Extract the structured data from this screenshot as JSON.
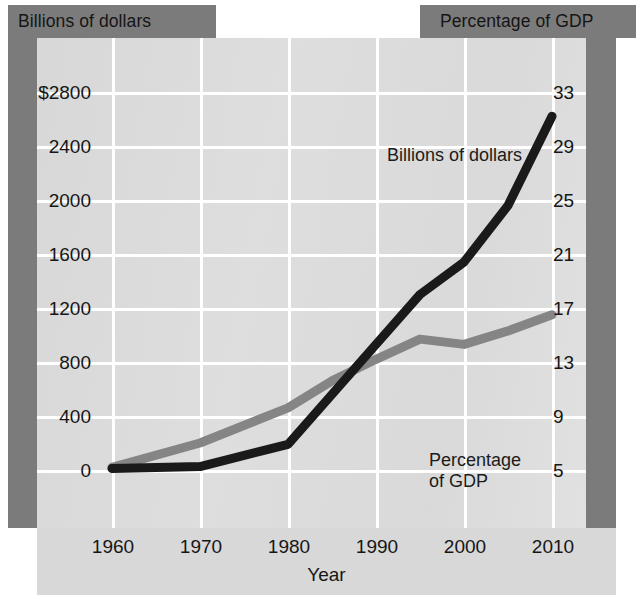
{
  "header": {
    "left_caption": "Billions of dollars",
    "right_caption": "Percentage of GDP"
  },
  "axes": {
    "x_title": "Year",
    "x_ticks": [
      "1960",
      "1970",
      "1980",
      "1990",
      "2000",
      "2010"
    ],
    "y_left_ticks": [
      "$2800",
      "2400",
      "2000",
      "1600",
      "1200",
      "800",
      "400",
      "0"
    ],
    "y_right_ticks": [
      "33",
      "29",
      "25",
      "21",
      "17",
      "13",
      "9",
      "5"
    ]
  },
  "annotations": {
    "dollars": "Billions of dollars",
    "gdp": "Percentage\nof GDP"
  },
  "colors": {
    "series_dollars": "#1a1a1a",
    "series_gdp": "#858585",
    "panel": "#dcdcdc",
    "band": "#7b7b7b",
    "gridline": "#ffffff",
    "text": "#161616"
  },
  "chart_data": {
    "type": "line",
    "title": "",
    "xlabel": "Year",
    "grid": true,
    "legend": "in-plot annotations",
    "x": [
      1960,
      1970,
      1980,
      1985,
      1990,
      1995,
      2000,
      2005,
      2010
    ],
    "xlim": [
      1960,
      2010
    ],
    "axes_spec": [
      {
        "id": "left",
        "label": "Billions of dollars",
        "ylim": [
          0,
          2800
        ],
        "ticks": [
          0,
          400,
          800,
          1200,
          1600,
          2000,
          2400,
          2800
        ],
        "tick_labels": [
          "0",
          "400",
          "800",
          "1200",
          "1600",
          "2000",
          "2400",
          "$2800"
        ]
      },
      {
        "id": "right",
        "label": "Percentage of GDP",
        "ylim": [
          5,
          33
        ],
        "ticks": [
          5,
          9,
          13,
          17,
          21,
          25,
          29,
          33
        ],
        "tick_labels": [
          "5",
          "9",
          "13",
          "17",
          "21",
          "25",
          "29",
          "33"
        ]
      }
    ],
    "series": [
      {
        "name": "Billions of dollars",
        "axis": "left",
        "color": "#1a1a1a",
        "values": [
          10,
          25,
          190,
          560,
          930,
          1300,
          1540,
          1960,
          2620
        ]
      },
      {
        "name": "Percentage of GDP",
        "axis": "right",
        "color": "#858585",
        "values": [
          5.2,
          7.0,
          9.6,
          11.6,
          13.2,
          14.7,
          14.3,
          15.3,
          16.5
        ]
      }
    ]
  }
}
